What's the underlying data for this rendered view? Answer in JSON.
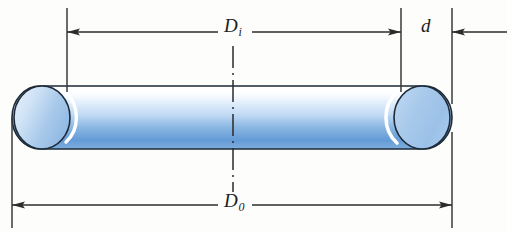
{
  "figure": {
    "name": "o-ring-cross-section-dimension-diagram",
    "background_color": "#fdfdfc",
    "line_color": "#2b2b2b"
  },
  "labels": {
    "inner_diameter": {
      "symbol": "D",
      "subscript": "i",
      "full": "Di"
    },
    "outer_diameter": {
      "symbol": "D",
      "subscript": "0",
      "full": "D0"
    },
    "cord_diameter": {
      "symbol": "d",
      "subscript": "",
      "full": "d"
    }
  },
  "dimensions": {
    "inner_diameter_line": {
      "name": "Di dimension line",
      "y": 32,
      "x_start": 67,
      "x_end": 401,
      "arrows": "both"
    },
    "outer_diameter_line": {
      "name": "D0 dimension line",
      "y": 205,
      "x_start": 12,
      "x_end": 452,
      "arrows": "both"
    },
    "cord_diameter_line": {
      "name": "d dimension line",
      "y": 32,
      "x_start": 452,
      "x_end": 507,
      "arrows": "left"
    }
  },
  "extension_lines": [
    {
      "name": "outer-left-extension",
      "x": 12,
      "y_start": 118,
      "y_end": 228
    },
    {
      "name": "inner-left-extension",
      "x": 67,
      "y_start": 8,
      "y_end": 92
    },
    {
      "name": "inner-right-extension",
      "x": 401,
      "y_start": 8,
      "y_end": 92
    },
    {
      "name": "outer-right-extension-top",
      "x": 452,
      "y_start": 8,
      "y_end": 104
    },
    {
      "name": "outer-right-extension-bottom",
      "x": 452,
      "y_start": 132,
      "y_end": 228
    }
  ],
  "centerline": {
    "name": "vertical-centerline",
    "x": 233,
    "y_start": 46,
    "y_end": 192,
    "style": "dash-dot"
  },
  "oring": {
    "name": "o-ring-body",
    "left": 12,
    "right": 452,
    "top": 86,
    "bottom": 149,
    "cap_radius_x": 28,
    "colors": {
      "tube_top": "#ffffff",
      "tube_upper": "#eaf3fc",
      "tube_mid": "#bcd8f2",
      "tube_lower": "#6a9fd8",
      "tube_bottom": "#8fb8e0",
      "cap_light": "#d8e8f8",
      "cap_mid": "#a9c9ea",
      "cap_dark": "#8ab4e0",
      "outline": "#1d2a38",
      "highlight": "#ffffff"
    }
  }
}
